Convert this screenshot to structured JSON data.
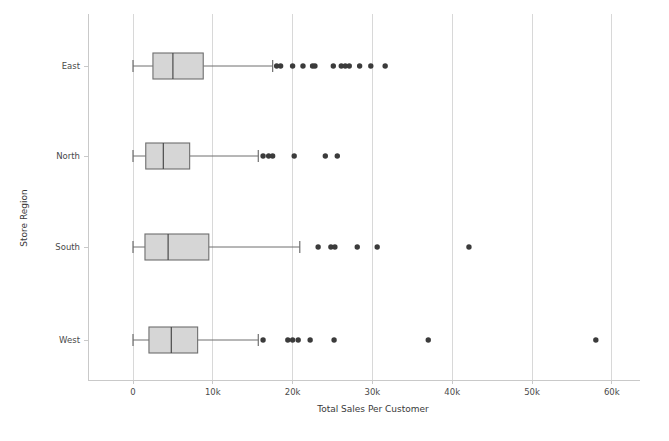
{
  "chart_data": {
    "type": "box",
    "title": "",
    "xlabel": "Total Sales Per Customer",
    "ylabel": "Store Region",
    "categories": [
      "East",
      "North",
      "South",
      "West"
    ],
    "xlim": [
      -3500,
      64000
    ],
    "xticks": [
      0,
      10000,
      20000,
      30000,
      40000,
      50000,
      60000
    ],
    "xticklabels": [
      "0",
      "10k",
      "20k",
      "30k",
      "40k",
      "50k",
      "60k"
    ],
    "grid": "vertical",
    "legend": "none",
    "orientation": "horizontal",
    "colors": {
      "box_fill": "#d6d6d6",
      "box_edge": "#6e6e6e",
      "median": "#4a4a4a",
      "outlier": "#3b3b3b",
      "grid": "#d8d8d8",
      "axis": "#c9c9c9",
      "text": "#4a4a4a"
    },
    "boxes": [
      {
        "category": "East",
        "whisker_low": 0,
        "q1": 2500,
        "median": 5000,
        "q3": 8800,
        "whisker_high": 17500,
        "outliers": [
          18000,
          18500,
          20000,
          21300,
          22500,
          22800,
          25100,
          26100,
          26600,
          27100,
          28400,
          29800,
          31600
        ]
      },
      {
        "category": "North",
        "whisker_low": 0,
        "q1": 1600,
        "median": 3800,
        "q3": 7100,
        "whisker_high": 15700,
        "outliers": [
          16300,
          17000,
          17500,
          20200,
          24100,
          25600
        ]
      },
      {
        "category": "South",
        "whisker_low": 0,
        "q1": 1500,
        "median": 4400,
        "q3": 9500,
        "whisker_high": 20900,
        "outliers": [
          23200,
          24800,
          25300,
          28100,
          30600,
          42100
        ]
      },
      {
        "category": "West",
        "whisker_low": 0,
        "q1": 2000,
        "median": 4800,
        "q3": 8100,
        "whisker_high": 15700,
        "outliers": [
          16300,
          19400,
          20000,
          20700,
          22200,
          25200,
          37000,
          58000
        ]
      }
    ]
  },
  "axes": {
    "x_title": "Total Sales Per Customer",
    "y_title": "Store Region"
  }
}
